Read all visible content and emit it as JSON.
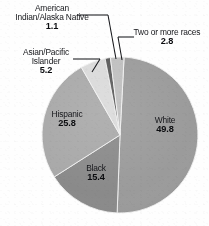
{
  "figure": {
    "background_color": "#fefefe",
    "text_color": "#15161a"
  },
  "chart_data": {
    "type": "pie",
    "title": "",
    "subtitle": "",
    "xlabel": "",
    "ylabel": "",
    "legend_position": "none",
    "grid": false,
    "units": "percent",
    "start_angle_deg": 3,
    "direction": "clockwise",
    "categories": [
      "White",
      "Black",
      "Hispanic",
      "Asian/Pacific Islander",
      "American Indian/Alaska Native",
      "Two or more races"
    ],
    "values": [
      49.8,
      15.4,
      25.8,
      5.2,
      1.1,
      2.8
    ],
    "colors": [
      "#9b9b9b",
      "#8a8a8a",
      "#a9a9a9",
      "#dadada",
      "#5a5a5a",
      "#bfbfbf"
    ],
    "slices": [
      {
        "id": "white",
        "label": "White",
        "value": "49.8",
        "value_num": 49.8,
        "color": "#9b9b9b",
        "label_placement": "inside"
      },
      {
        "id": "black",
        "label": "Black",
        "value": "15.4",
        "value_num": 15.4,
        "color": "#8a8a8a",
        "label_placement": "inside"
      },
      {
        "id": "hispanic",
        "label": "Hispanic",
        "value": "25.8",
        "value_num": 25.8,
        "color": "#a9a9a9",
        "label_placement": "inside"
      },
      {
        "id": "asian-pacific-islander",
        "label": "Asian/Pacific",
        "label_line2": "Islander",
        "value": "5.2",
        "value_num": 5.2,
        "color": "#dadada",
        "label_placement": "outside-leader"
      },
      {
        "id": "american-indian-alaska-native",
        "label": "American",
        "label_line2": "Indian/Alaska Native",
        "value": "1.1",
        "value_num": 1.1,
        "color": "#5a5a5a",
        "label_placement": "outside-leader"
      },
      {
        "id": "two-or-more-races",
        "label": "Two or more races",
        "value": "2.8",
        "value_num": 2.8,
        "color": "#bfbfbf",
        "label_placement": "outside-leader"
      }
    ]
  }
}
